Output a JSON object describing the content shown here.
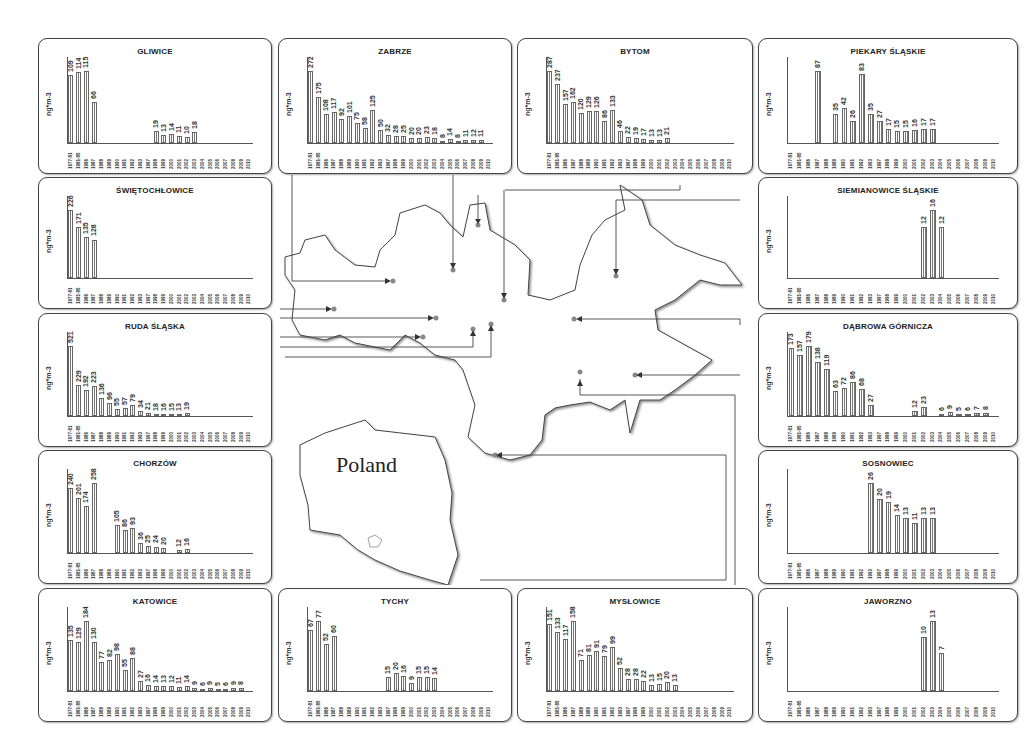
{
  "figure": {
    "unit_label": "ng*m-3",
    "map_label": "Poland"
  },
  "colors": {
    "bar_fill": "#777777",
    "border": "#444444",
    "background": "#ffffff"
  },
  "chart_data": [
    {
      "type": "bar",
      "title": "GLIWICE",
      "ylabel": "ng*m-3",
      "categories": [
        "1977-81",
        "1981-85",
        "1986",
        "1987",
        "1988",
        "1989",
        "1990",
        "1991",
        "1992",
        "1993",
        "1997",
        "1998",
        "1999",
        "2000",
        "2001",
        "2002",
        "2003",
        "2004",
        "2005",
        "2006",
        "2007",
        "2008",
        "2009",
        "2010"
      ],
      "values": [
        109,
        114,
        115,
        66,
        null,
        null,
        null,
        null,
        null,
        null,
        null,
        19,
        13,
        14,
        11,
        10,
        18,
        null,
        null,
        null,
        null,
        null,
        null,
        null
      ]
    },
    {
      "type": "bar",
      "title": "ZABRZE",
      "ylabel": "ng*m-3",
      "categories": [
        "1977-81",
        "1981-85",
        "1986",
        "1987",
        "1988",
        "1989",
        "1990",
        "1991",
        "1992",
        "1993",
        "1997",
        "1998",
        "1999",
        "2000",
        "2001",
        "2002",
        "2003",
        "2004",
        "2005",
        "2006",
        "2007",
        "2008",
        "2009",
        "2010"
      ],
      "values": [
        272,
        175,
        108,
        117,
        92,
        101,
        75,
        58,
        125,
        50,
        32,
        28,
        25,
        20,
        20,
        23,
        18,
        8,
        14,
        8,
        11,
        12,
        11,
        null
      ]
    },
    {
      "type": "bar",
      "title": "BYTOM",
      "ylabel": "ng*m-3",
      "categories": [
        "1977-81",
        "1981-85",
        "1986",
        "1987",
        "1988",
        "1989",
        "1990",
        "1991",
        "1992",
        "1993",
        "1997",
        "1998",
        "1999",
        "2000",
        "2001",
        "2002",
        "2003",
        "2004",
        "2005",
        "2006",
        "2007",
        "2008",
        "2009",
        "2010"
      ],
      "values": [
        287,
        237,
        157,
        162,
        120,
        129,
        126,
        86,
        133,
        46,
        22,
        19,
        17,
        13,
        13,
        21,
        null,
        null,
        null,
        null,
        null,
        null,
        null,
        null
      ]
    },
    {
      "type": "bar",
      "title": "PIEKARY ŚLĄSKIE",
      "ylabel": "ng*m-3",
      "categories": [
        "1977-81",
        "1981-85",
        "1986",
        "1987",
        "1988",
        "1989",
        "1990",
        "1991",
        "1992",
        "1993",
        "1997",
        "1998",
        "1999",
        "2000",
        "2001",
        "2002",
        "2003",
        "2004",
        "2005",
        "2006",
        "2007",
        "2008",
        "2009",
        "2010"
      ],
      "values": [
        null,
        null,
        null,
        87,
        null,
        35,
        42,
        26,
        83,
        35,
        27,
        17,
        15,
        15,
        16,
        17,
        17,
        null,
        null,
        null,
        null,
        null,
        null,
        null
      ]
    },
    {
      "type": "bar",
      "title": "ŚWIĘTOCHŁOWICE",
      "ylabel": "ng*m-3",
      "categories": [
        "1977-81",
        "1981-85",
        "1986",
        "1987",
        "1988",
        "1989",
        "1990",
        "1991",
        "1992",
        "1993",
        "1997",
        "1998",
        "1999",
        "2000",
        "2001",
        "2002",
        "2003",
        "2004",
        "2005",
        "2006",
        "2007",
        "2008",
        "2009",
        "2010"
      ],
      "values": [
        226,
        171,
        135,
        128,
        null,
        null,
        null,
        null,
        null,
        null,
        null,
        null,
        null,
        null,
        null,
        null,
        null,
        null,
        null,
        null,
        null,
        null,
        null,
        null
      ]
    },
    {
      "type": "bar",
      "title": "SIEMIANOWICE ŚLĄSKIE",
      "ylabel": "ng*m-3",
      "categories": [
        "1977-81",
        "1981-85",
        "1986",
        "1987",
        "1988",
        "1989",
        "1990",
        "1991",
        "1992",
        "1993",
        "1997",
        "1998",
        "1999",
        "2000",
        "2001",
        "2002",
        "2003",
        "2004",
        "2005",
        "2006",
        "2007",
        "2008",
        "2009",
        "2010"
      ],
      "values": [
        null,
        null,
        null,
        null,
        null,
        null,
        null,
        null,
        null,
        null,
        null,
        null,
        null,
        null,
        null,
        12,
        16,
        12,
        null,
        null,
        null,
        null,
        null,
        null
      ]
    },
    {
      "type": "bar",
      "title": "RUDA ŚLĄSKA",
      "ylabel": "ng*m-3",
      "categories": [
        "1977-81",
        "1981-85",
        "1986",
        "1987",
        "1988",
        "1989",
        "1990",
        "1991",
        "1992",
        "1993",
        "1997",
        "1998",
        "1999",
        "2000",
        "2001",
        "2002",
        "2003",
        "2004",
        "2005",
        "2006",
        "2007",
        "2008",
        "2009",
        "2010"
      ],
      "values": [
        521,
        229,
        192,
        223,
        136,
        96,
        55,
        57,
        79,
        34,
        21,
        18,
        16,
        15,
        13,
        19,
        null,
        null,
        null,
        null,
        null,
        null,
        null,
        null
      ]
    },
    {
      "type": "bar",
      "title": "DĄBROWA GÓRNICZA",
      "ylabel": "ng*m-3",
      "categories": [
        "1977-81",
        "1981-85",
        "1986",
        "1987",
        "1988",
        "1989",
        "1990",
        "1991",
        "1992",
        "1993",
        "1997",
        "1998",
        "1999",
        "2000",
        "2001",
        "2002",
        "2003",
        "2004",
        "2005",
        "2006",
        "2007",
        "2008",
        "2009",
        "2010"
      ],
      "values": [
        173,
        157,
        179,
        138,
        119,
        63,
        72,
        86,
        68,
        27,
        null,
        null,
        null,
        null,
        12,
        23,
        null,
        6,
        9,
        5,
        6,
        7,
        8,
        null
      ]
    },
    {
      "type": "bar",
      "title": "CHORZÓW",
      "ylabel": "ng*m-3",
      "categories": [
        "1977-81",
        "1981-85",
        "1986",
        "1987",
        "1988",
        "1989",
        "1990",
        "1991",
        "1992",
        "1993",
        "1997",
        "1998",
        "1999",
        "2000",
        "2001",
        "2002",
        "2003",
        "2004",
        "2005",
        "2006",
        "2007",
        "2008",
        "2009",
        "2010"
      ],
      "values": [
        240,
        201,
        174,
        258,
        null,
        null,
        105,
        86,
        93,
        36,
        25,
        24,
        20,
        null,
        12,
        16,
        null,
        null,
        null,
        null,
        null,
        null,
        null,
        null
      ]
    },
    {
      "type": "bar",
      "title": "SOSNOWIEC",
      "ylabel": "ng*m-3",
      "categories": [
        "1977-81",
        "1981-85",
        "1986",
        "1987",
        "1988",
        "1989",
        "1990",
        "1991",
        "1992",
        "1993",
        "1997",
        "1998",
        "1999",
        "2000",
        "2001",
        "2002",
        "2003",
        "2004",
        "2005",
        "2006",
        "2007",
        "2008",
        "2009",
        "2010"
      ],
      "values": [
        null,
        null,
        null,
        null,
        null,
        null,
        null,
        null,
        null,
        26,
        20,
        19,
        14,
        13,
        11,
        13,
        13,
        null,
        null,
        null,
        null,
        null,
        null,
        null
      ]
    },
    {
      "type": "bar",
      "title": "KATOWICE",
      "ylabel": "ng*m-3",
      "categories": [
        "1977-81",
        "1981-85",
        "1986",
        "1987",
        "1988",
        "1989",
        "1990",
        "1991",
        "1992",
        "1993",
        "1997",
        "1998",
        "1999",
        "2000",
        "2001",
        "2002",
        "2003",
        "2004",
        "2005",
        "2006",
        "2007",
        "2008",
        "2009",
        "2010"
      ],
      "values": [
        135,
        129,
        184,
        130,
        77,
        82,
        98,
        55,
        88,
        27,
        16,
        14,
        13,
        12,
        11,
        14,
        9,
        6,
        9,
        5,
        6,
        9,
        8,
        null
      ]
    },
    {
      "type": "bar",
      "title": "TYCHY",
      "ylabel": "ng*m-3",
      "categories": [
        "1977-81",
        "1981-85",
        "1986",
        "1987",
        "1988",
        "1989",
        "1990",
        "1991",
        "1992",
        "1993",
        "1997",
        "1998",
        "1999",
        "2000",
        "2001",
        "2002",
        "2003",
        "2004",
        "2005",
        "2006",
        "2007",
        "2008",
        "2009",
        "2010"
      ],
      "values": [
        67,
        77,
        52,
        60,
        null,
        null,
        null,
        null,
        null,
        null,
        15,
        20,
        16,
        9,
        15,
        15,
        14,
        null,
        null,
        null,
        null,
        null,
        null,
        null
      ]
    },
    {
      "type": "bar",
      "title": "MYSŁOWICE",
      "ylabel": "ng*m-3",
      "categories": [
        "1977-81",
        "1981-85",
        "1986",
        "1987",
        "1988",
        "1989",
        "1990",
        "1991",
        "1992",
        "1993",
        "1997",
        "1998",
        "1999",
        "2000",
        "2001",
        "2002",
        "2003",
        "2004",
        "2005",
        "2006",
        "2007",
        "2008",
        "2009",
        "2010"
      ],
      "values": [
        151,
        133,
        117,
        158,
        71,
        81,
        91,
        79,
        99,
        52,
        28,
        28,
        22,
        13,
        15,
        20,
        13,
        null,
        null,
        null,
        null,
        null,
        null,
        null
      ]
    },
    {
      "type": "bar",
      "title": "JAWORZNO",
      "ylabel": "ng*m-3",
      "categories": [
        "1977-81",
        "1981-85",
        "1986",
        "1987",
        "1988",
        "1989",
        "1990",
        "1991",
        "1992",
        "1993",
        "1997",
        "1998",
        "1999",
        "2000",
        "2001",
        "2002",
        "2003",
        "2004",
        "2005",
        "2006",
        "2007",
        "2008",
        "2009",
        "2010"
      ],
      "values": [
        null,
        null,
        null,
        null,
        null,
        null,
        null,
        null,
        null,
        null,
        null,
        null,
        null,
        null,
        null,
        10,
        13,
        7,
        null,
        null,
        null,
        null,
        null,
        null
      ]
    }
  ]
}
